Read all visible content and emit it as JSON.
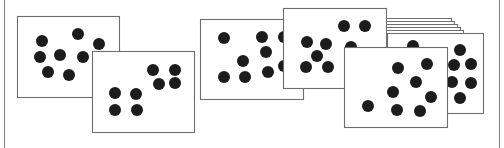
{
  "figure": {
    "colors": {
      "background": "#ffffff",
      "frame": "#8a8a8a",
      "card_border": "#6e6e6e",
      "card_fill": "#ffffff",
      "dot": "#1c1c1c"
    },
    "frame": {
      "left_x": 4,
      "right_x": 499
    },
    "dot_radius": 6,
    "groups": [
      {
        "name": "pair-left",
        "cards": [
          {
            "id": "card-1",
            "x": 17,
            "y": 16,
            "w": 102,
            "h": 81,
            "dots": [
              [
                42,
                41
              ],
              [
                78,
                34
              ],
              [
                99,
                44
              ],
              [
                40,
                57
              ],
              [
                60,
                55
              ],
              [
                83,
                57
              ],
              [
                48,
                72
              ],
              [
                69,
                75
              ]
            ]
          },
          {
            "id": "card-2",
            "x": 92,
            "y": 51,
            "w": 102,
            "h": 81,
            "dots": [
              [
                115,
                93
              ],
              [
                136,
                94
              ],
              [
                115,
                110
              ],
              [
                137,
                110
              ],
              [
                153,
                70
              ],
              [
                175,
                70
              ],
              [
                159,
                84
              ],
              [
                175,
                83
              ]
            ]
          }
        ]
      },
      {
        "name": "pair-middle",
        "cards": [
          {
            "id": "card-3",
            "x": 200,
            "y": 19,
            "w": 103,
            "h": 80,
            "dots": [
              [
                224,
                38
              ],
              [
                262,
                37
              ],
              [
                284,
                37
              ],
              [
                266,
                52
              ],
              [
                243,
                61
              ],
              [
                224,
                77
              ],
              [
                245,
                77
              ],
              [
                268,
                72
              ],
              [
                284,
                66
              ]
            ]
          },
          {
            "id": "card-4",
            "x": 283,
            "y": 8,
            "w": 103,
            "h": 80,
            "dots": [
              [
                307,
                42
              ],
              [
                326,
                44
              ],
              [
                317,
                56
              ],
              [
                306,
                67
              ],
              [
                328,
                67
              ],
              [
                344,
                26
              ],
              [
                365,
                26
              ],
              [
                351,
                47
              ],
              [
                366,
                54
              ]
            ]
          }
        ]
      },
      {
        "name": "stack-right",
        "stack_edges": [
          {
            "x": 386,
            "y": 18,
            "w": 65,
            "h": 80
          },
          {
            "x": 386,
            "y": 21,
            "w": 68,
            "h": 80
          },
          {
            "x": 386,
            "y": 24,
            "w": 71,
            "h": 80
          },
          {
            "x": 386,
            "y": 27,
            "w": 74,
            "h": 80
          },
          {
            "x": 386,
            "y": 30,
            "w": 77,
            "h": 80
          }
        ],
        "cards": [
          {
            "id": "card-5",
            "x": 387,
            "y": 33,
            "w": 96,
            "h": 80,
            "dots": [
              [
                413,
                46
              ],
              [
                460,
                50
              ],
              [
                454,
                65
              ],
              [
                471,
                64
              ],
              [
                452,
                82
              ],
              [
                471,
                83
              ],
              [
                460,
                98
              ]
            ]
          },
          {
            "id": "card-6",
            "x": 344,
            "y": 47,
            "w": 103,
            "h": 80,
            "dots": [
              [
                398,
                68
              ],
              [
                427,
                64
              ],
              [
                416,
                82
              ],
              [
                393,
                92
              ],
              [
                431,
                97
              ],
              [
                368,
                106
              ],
              [
                397,
                110
              ],
              [
                420,
                111
              ]
            ]
          }
        ]
      }
    ]
  }
}
